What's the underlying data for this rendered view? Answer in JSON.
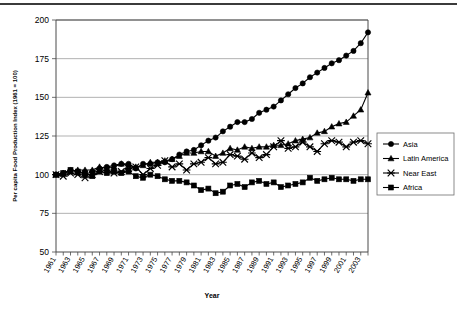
{
  "chart_data": {
    "type": "line",
    "title": "",
    "xlabel": "Year",
    "ylabel": "Per capita Food Production Index (1961 = 100)",
    "ylim": [
      50,
      200
    ],
    "ytick_values": [
      50,
      75,
      100,
      125,
      150,
      175,
      200
    ],
    "ytick_labels": [
      "50",
      "75",
      "100",
      "125",
      "150",
      "175",
      "200"
    ],
    "xlim": [
      1961,
      2004
    ],
    "grid": "horizontal",
    "legend_position": "right",
    "x": [
      1961,
      1962,
      1963,
      1964,
      1965,
      1966,
      1967,
      1968,
      1969,
      1970,
      1971,
      1972,
      1973,
      1974,
      1975,
      1976,
      1977,
      1978,
      1979,
      1980,
      1981,
      1982,
      1983,
      1984,
      1985,
      1986,
      1987,
      1988,
      1989,
      1990,
      1991,
      1992,
      1993,
      1994,
      1995,
      1996,
      1997,
      1998,
      1999,
      2000,
      2001,
      2002,
      2003,
      2004
    ],
    "xtick_labels": [
      "1961",
      "1963",
      "1965",
      "1967",
      "1969",
      "1971",
      "1973",
      "1975",
      "1977",
      "1979",
      "1981",
      "1983",
      "1985",
      "1987",
      "1989",
      "1991",
      "1993",
      "1995",
      "1997",
      "1999",
      "2001",
      "2003"
    ],
    "series": [
      {
        "name": "Asia",
        "marker": "circle",
        "values": [
          100,
          101,
          103,
          102,
          100,
          102,
          104,
          105,
          106,
          107,
          107,
          104,
          107,
          107,
          108,
          108,
          110,
          113,
          115,
          116,
          119,
          122,
          124,
          128,
          131,
          134,
          134,
          136,
          140,
          142,
          144,
          148,
          152,
          156,
          159,
          163,
          166,
          169,
          172,
          174,
          177,
          180,
          185,
          192
        ]
      },
      {
        "name": "Latin America",
        "marker": "triangle",
        "values": [
          100,
          101,
          102,
          103,
          103,
          103,
          105,
          104,
          105,
          107,
          106,
          105,
          106,
          108,
          108,
          109,
          110,
          112,
          114,
          114,
          115,
          115,
          112,
          114,
          117,
          116,
          118,
          117,
          118,
          118,
          119,
          119,
          120,
          122,
          123,
          124,
          127,
          128,
          131,
          133,
          134,
          138,
          142,
          153
        ]
      },
      {
        "name": "Near East",
        "marker": "x",
        "values": [
          100,
          99,
          101,
          100,
          98,
          100,
          102,
          103,
          101,
          102,
          104,
          105,
          100,
          104,
          106,
          109,
          105,
          107,
          103,
          107,
          108,
          111,
          107,
          108,
          113,
          112,
          110,
          114,
          111,
          113,
          118,
          122,
          117,
          118,
          121,
          118,
          115,
          120,
          122,
          121,
          118,
          121,
          122,
          120
        ]
      },
      {
        "name": "Africa",
        "marker": "square",
        "values": [
          100,
          101,
          103,
          102,
          101,
          99,
          102,
          101,
          102,
          101,
          102,
          99,
          98,
          100,
          99,
          97,
          96,
          96,
          95,
          93,
          90,
          91,
          88,
          89,
          93,
          94,
          92,
          95,
          96,
          94,
          95,
          92,
          93,
          94,
          95,
          98,
          96,
          97,
          98,
          97,
          97,
          96,
          97,
          97
        ]
      }
    ]
  },
  "legend": {
    "items": [
      {
        "label": "Asia"
      },
      {
        "label": "Latin America"
      },
      {
        "label": "Near East"
      },
      {
        "label": "Africa"
      }
    ]
  }
}
